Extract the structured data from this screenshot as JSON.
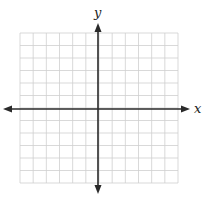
{
  "diagram": {
    "type": "coordinate-plane",
    "axes": {
      "x_label": "x",
      "y_label": "y"
    },
    "grid": {
      "columns": 12,
      "rows": 12,
      "line_color": "#cfcfcf",
      "axis_color": "#2a2a2a"
    },
    "layout": {
      "left": 20,
      "top": 33,
      "right": 178,
      "bottom": 183,
      "origin_x": 98,
      "origin_y": 109
    }
  }
}
